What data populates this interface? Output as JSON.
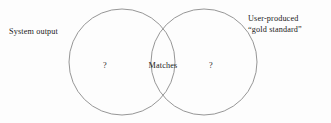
{
  "figure": {
    "background_color": "#fdfdfd",
    "stroke_color": "#8a8a8a",
    "text_color": "#1a1a1a"
  },
  "labels": {
    "left_circle_label": "System output",
    "right_circle_label_line1": "User-produced",
    "right_circle_label_line2": "“gold standard”"
  },
  "regions": {
    "left_only": "?",
    "intersection": "Matches",
    "right_only": "?"
  },
  "geometry": {
    "left_circle": {
      "cx": 122,
      "cy": 62,
      "r": 53
    },
    "right_circle": {
      "cx": 204,
      "cy": 62,
      "r": 53
    },
    "stroke_width": 0.9
  }
}
